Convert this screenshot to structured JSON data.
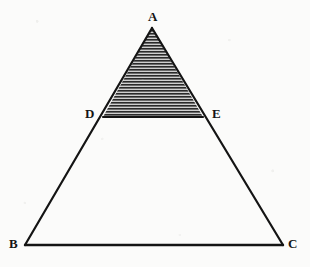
{
  "figure": {
    "background_color": "#fbfbfa",
    "stroke_color": "#141414",
    "hatch_color": "#2a2a2a",
    "hatch_gap_color": "#c9c9c9",
    "labels": {
      "apex": "A",
      "base_left": "B",
      "base_right": "C",
      "mid_left": "D",
      "mid_right": "E"
    },
    "vertices": [
      {
        "name": "A",
        "label": "A",
        "x": 152,
        "y": 28,
        "label_x": 148,
        "label_y": 10
      },
      {
        "name": "B",
        "label": "B",
        "x": 25,
        "y": 245,
        "label_x": 9,
        "label_y": 237
      },
      {
        "name": "C",
        "label": "C",
        "x": 283,
        "y": 245,
        "label_x": 288,
        "label_y": 237
      },
      {
        "name": "D",
        "label": "D",
        "x": 103,
        "y": 117,
        "label_x": 85,
        "label_y": 107
      },
      {
        "name": "E",
        "label": "E",
        "x": 203,
        "y": 117,
        "label_x": 212,
        "label_y": 107
      }
    ],
    "segments": [
      {
        "name": "side-AB",
        "from": "A",
        "to": "B",
        "width": 2.2
      },
      {
        "name": "side-AC",
        "from": "A",
        "to": "C",
        "width": 2.2
      },
      {
        "name": "base-BC",
        "from": "B",
        "to": "C",
        "width": 2.4
      },
      {
        "name": "segment-DE",
        "from": "D",
        "to": "E",
        "width": 2.2
      }
    ],
    "shaded_region": {
      "name": "triangle-ADE",
      "points": "A,D,E",
      "fill": "horizontal-hatch",
      "hatch_spacing_px": 3,
      "hatch_line_width_px": 1.5
    }
  }
}
